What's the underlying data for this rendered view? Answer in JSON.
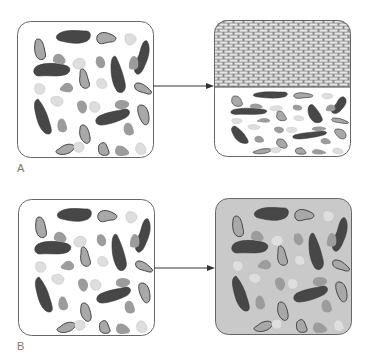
{
  "figure": {
    "rows": [
      {
        "label": "A",
        "before": {
          "description": "container with mixed particles on white background",
          "background": "#ffffff"
        },
        "after": {
          "description": "particles compressed into lower portion beneath brick wall layer",
          "background": "#ffffff",
          "wall_fraction": 0.49
        }
      },
      {
        "label": "B",
        "before": {
          "description": "container with mixed particles on white background",
          "background": "#ffffff"
        },
        "after": {
          "description": "same particle arrangement on uniformly gray background",
          "background": "#c9c9c9"
        }
      }
    ],
    "colors": {
      "dark_particle": "#474747",
      "medium_particle": "#9c9c9c",
      "outlined_particle": "#a8a8a8",
      "light_particle": "#dedede",
      "outline": "#555555",
      "border": "#666666",
      "arrow": "#333333",
      "brick": "#e6e6e6",
      "mortar": "#8a8a8a",
      "label_text": "#777777"
    }
  }
}
